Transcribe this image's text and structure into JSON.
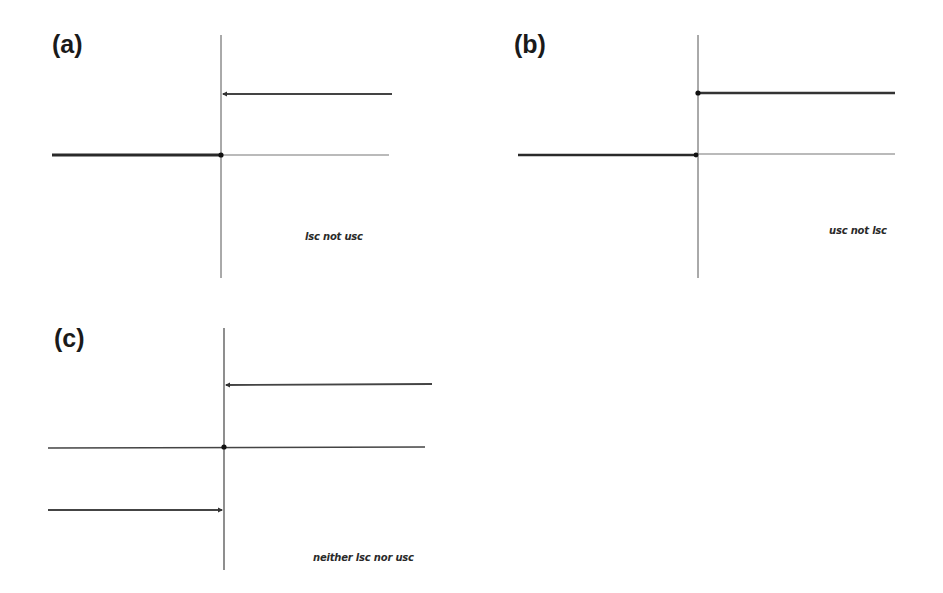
{
  "panels": [
    {
      "label": "(a)",
      "caption": "lsc not usc",
      "description": "left segment thick with closed dot at junction; upper right branch with open end at axis"
    },
    {
      "label": "(b)",
      "caption": "usc not lsc",
      "description": "closed dot at start of upper right branch; closed dot at end of left segment"
    },
    {
      "label": "(c)",
      "caption": "neither lsc nor usc",
      "description": "isolated point on middle line; upper right and lower left branches open at axis"
    }
  ],
  "colors": {
    "line": "#3a3a3a",
    "thin_line": "#6a6a6a",
    "dot": "#111111",
    "background": "#ffffff"
  }
}
